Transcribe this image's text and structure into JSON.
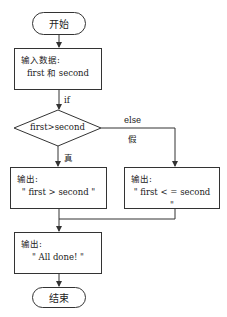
{
  "flowchart": {
    "start": {
      "label": "开始"
    },
    "input": {
      "title": "输入数据:",
      "content": "first 和 second"
    },
    "if_label": "if",
    "decision": {
      "condition": "first>second"
    },
    "branch_true": {
      "label": "真"
    },
    "branch_false": {
      "else_label": "else",
      "label": "假"
    },
    "output_true": {
      "title": "输出:",
      "content": "\" first > second \""
    },
    "output_false": {
      "title": "输出:",
      "content": "\" first < = second \""
    },
    "output_done": {
      "title": "输出:",
      "content": "\" All done! \""
    },
    "end": {
      "label": "结束"
    }
  },
  "colors": {
    "stroke": "#333333",
    "background": "#ffffff",
    "text": "#222222"
  }
}
